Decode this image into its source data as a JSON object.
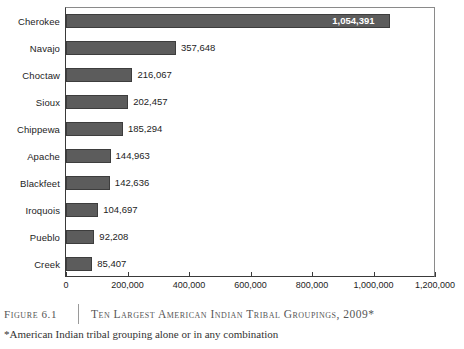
{
  "chart_data": {
    "type": "bar",
    "orientation": "horizontal",
    "title": "Ten Largest American Indian Tribal Groupings, 2009*",
    "xlabel": "",
    "ylabel": "",
    "xlim": [
      0,
      1200000
    ],
    "grid": false,
    "legend": null,
    "categories": [
      "Cherokee",
      "Navajo",
      "Choctaw",
      "Sioux",
      "Chippewa",
      "Apache",
      "Blackfeet",
      "Iroquois",
      "Pueblo",
      "Creek"
    ],
    "values": [
      1054391,
      357648,
      216067,
      202457,
      185294,
      144963,
      142636,
      104697,
      92208,
      85407
    ],
    "value_labels": [
      "1,054,391",
      "357,648",
      "216,067",
      "202,457",
      "185,294",
      "144,963",
      "142,636",
      "104,697",
      "92,208",
      "85,407"
    ],
    "label_placement": [
      "inside",
      "outside",
      "outside",
      "outside",
      "outside",
      "outside",
      "outside",
      "outside",
      "outside",
      "outside"
    ],
    "xticks": [
      0,
      200000,
      400000,
      600000,
      800000,
      1000000,
      1200000
    ],
    "xtick_labels": [
      "0",
      "200,000",
      "400,000",
      "600,000",
      "800,000",
      "1,000,000",
      "1,200,000"
    ],
    "bar_color": "#5c5c5c",
    "bar_edge_color": "#3d3d3d",
    "inside_label_color": "#ffffff",
    "background_color": "#ffffff"
  },
  "caption": {
    "figure_number": "Figure 6.1",
    "title": "Ten Largest American Indian Tribal Groupings, 2009*",
    "footnote": "*American Indian tribal grouping alone or in any combination"
  }
}
